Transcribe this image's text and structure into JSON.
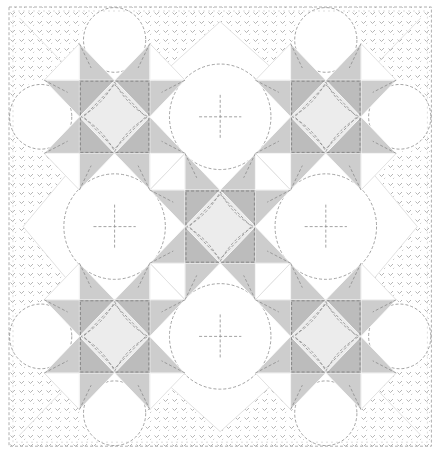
{
  "figure": {
    "title": "Star quilt illustration"
  },
  "layout": {
    "width": 435,
    "height": 454,
    "grid": {
      "cols": 12,
      "rows": 12,
      "x0": 9,
      "y0": 7,
      "ux": 35.2,
      "uy": 36.6
    }
  },
  "colors": {
    "background": "#ffffff",
    "border_stitch": "#9a9a9a",
    "corner_dark": "#bcbcbc",
    "star_point": "#cdcdcd",
    "center_diamond": "#ececec",
    "white_patch": "#ffffff",
    "seam": "#e2e2e2",
    "stitch": "#8c8c8c"
  },
  "stars": [
    {
      "name": "star-top-left",
      "col": 2,
      "row": 2
    },
    {
      "name": "star-top-right",
      "col": 8,
      "row": 2
    },
    {
      "name": "star-center",
      "col": 5,
      "row": 5
    },
    {
      "name": "star-bottom-left",
      "col": 2,
      "row": 8
    },
    {
      "name": "star-bottom-right",
      "col": 8,
      "row": 8
    }
  ],
  "small_squares": [
    {
      "name": "hourglass-square-1",
      "col": 4,
      "row": 4
    },
    {
      "name": "hourglass-square-2",
      "col": 7,
      "row": 4
    },
    {
      "name": "hourglass-square-3",
      "col": 4,
      "row": 7
    },
    {
      "name": "hourglass-square-4",
      "col": 7,
      "row": 7
    }
  ],
  "circles": [
    {
      "name": "quilting-circle-top",
      "col": 6,
      "row": 3,
      "r": 1.55
    },
    {
      "name": "quilting-circle-left",
      "col": 3,
      "row": 6,
      "r": 1.55
    },
    {
      "name": "quilting-circle-right",
      "col": 9,
      "row": 6,
      "r": 1.55
    },
    {
      "name": "quilting-circle-bottom",
      "col": 6,
      "row": 9,
      "r": 1.55
    },
    {
      "name": "quilting-circle-tl-top",
      "col": 3,
      "row": 0.9,
      "r": 0.95
    },
    {
      "name": "quilting-circle-tl-left",
      "col": 0.9,
      "row": 3,
      "r": 0.95
    },
    {
      "name": "quilting-circle-tr-top",
      "col": 9,
      "row": 0.9,
      "r": 0.95
    },
    {
      "name": "quilting-circle-tr-right",
      "col": 11.1,
      "row": 3,
      "r": 0.95
    },
    {
      "name": "quilting-circle-bl-left",
      "col": 0.9,
      "row": 9,
      "r": 0.95
    },
    {
      "name": "quilting-circle-bl-bottom",
      "col": 3,
      "row": 11.1,
      "r": 0.95
    },
    {
      "name": "quilting-circle-br-right",
      "col": 11.1,
      "row": 9,
      "r": 0.95
    },
    {
      "name": "quilting-circle-br-bottom",
      "col": 9,
      "row": 11.1,
      "r": 0.95
    }
  ]
}
